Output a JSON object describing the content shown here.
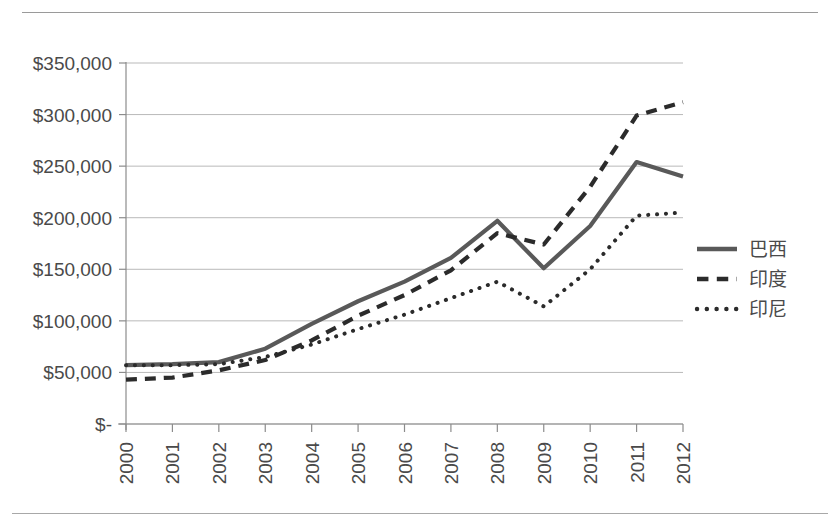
{
  "chart_data": {
    "type": "line",
    "title": "",
    "xlabel": "",
    "ylabel": "",
    "categories": [
      "2000",
      "2001",
      "2002",
      "2003",
      "2004",
      "2005",
      "2006",
      "2007",
      "2008",
      "2009",
      "2010",
      "2011",
      "2012"
    ],
    "x": [
      2000,
      2001,
      2002,
      2003,
      2004,
      2005,
      2006,
      2007,
      2008,
      2009,
      2010,
      2011,
      2012
    ],
    "series": [
      {
        "name": "巴西",
        "style": "solid",
        "color": "#595959",
        "values": [
          57000,
          58000,
          60000,
          73000,
          97000,
          119000,
          138000,
          161000,
          197000,
          151000,
          192000,
          254000,
          240000
        ]
      },
      {
        "name": "印度",
        "style": "dashed",
        "color": "#2b2b2b",
        "values": [
          43000,
          45000,
          52000,
          62000,
          81000,
          105000,
          125000,
          149000,
          185000,
          174000,
          230000,
          299000,
          312000
        ]
      },
      {
        "name": "印尼",
        "style": "dotted",
        "color": "#2b2b2b",
        "values": [
          57000,
          57000,
          58000,
          65000,
          77000,
          92000,
          106000,
          122000,
          138000,
          114000,
          150000,
          202000,
          205000
        ]
      }
    ],
    "ylim": [
      0,
      350000
    ],
    "yticks": [
      0,
      50000,
      100000,
      150000,
      200000,
      250000,
      300000,
      350000
    ],
    "ytick_labels": [
      "$-",
      "$50,000",
      "$100,000",
      "$150,000",
      "$200,000",
      "$250,000",
      "$300,000",
      "$350,000"
    ],
    "grid": true,
    "grid_axis": "y",
    "legend_position": "right",
    "xtick_rotation": -90
  },
  "axes": {
    "y_labels": [
      "$350,000",
      "$300,000",
      "$250,000",
      "$200,000",
      "$150,000",
      "$100,000",
      "$50,000",
      "$-"
    ],
    "x_labels": [
      "2000",
      "2001",
      "2002",
      "2003",
      "2004",
      "2005",
      "2006",
      "2007",
      "2008",
      "2009",
      "2010",
      "2011",
      "2012"
    ]
  },
  "legend": {
    "items": [
      {
        "label": "巴西",
        "style": "solid"
      },
      {
        "label": "印度",
        "style": "dashed"
      },
      {
        "label": "印尼",
        "style": "dotted"
      }
    ]
  },
  "colors": {
    "series_brazil": "#595959",
    "series_india": "#2b2b2b",
    "series_indonesia": "#2b2b2b",
    "grid": "#b9b9b9",
    "axis": "#8c8c8c",
    "text": "#4a4a4a",
    "background": "#ffffff"
  }
}
